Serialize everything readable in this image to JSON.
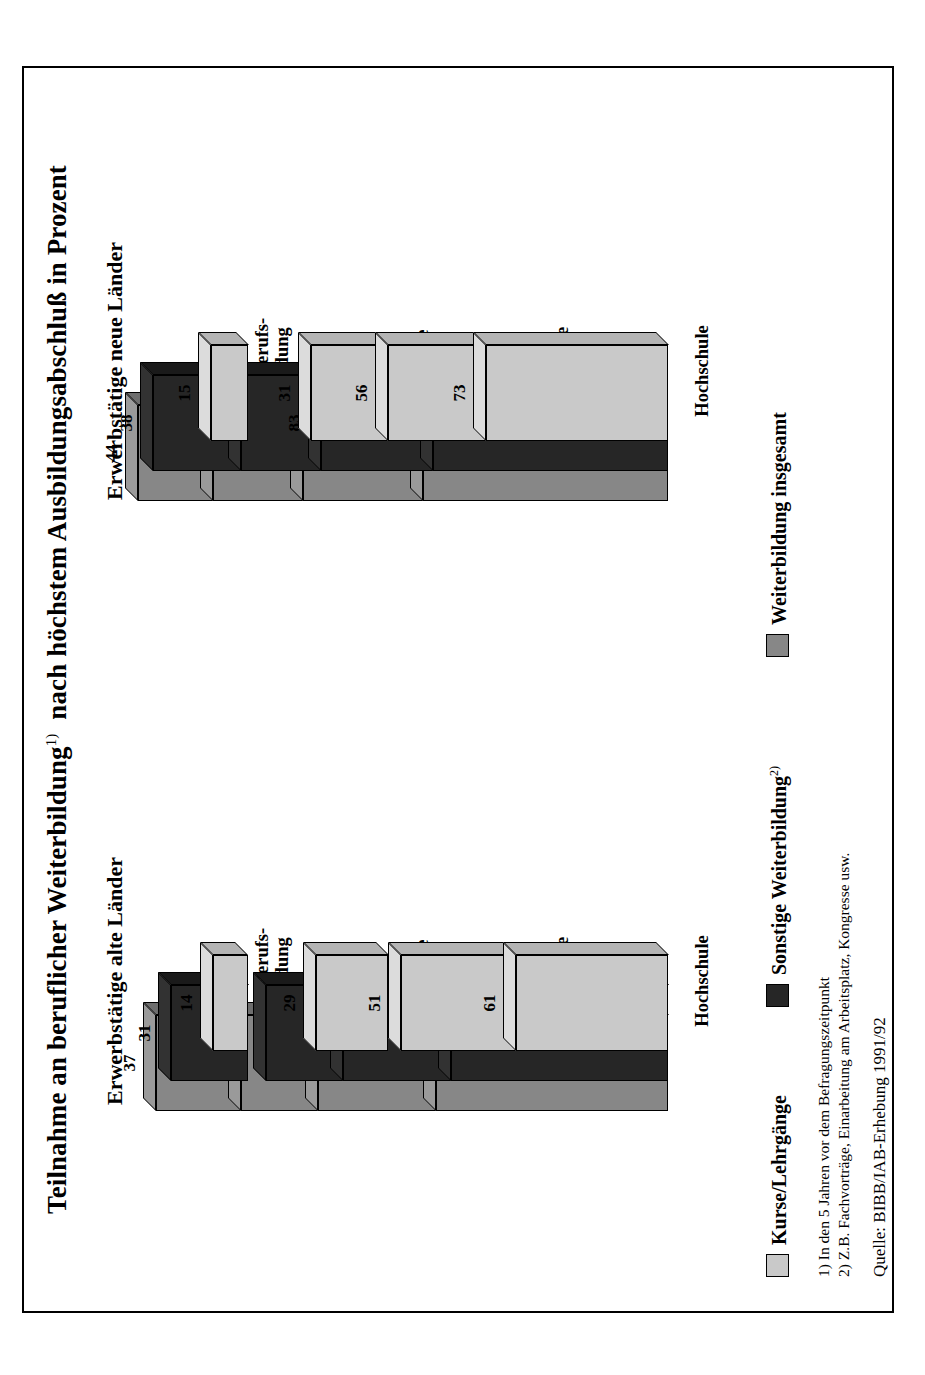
{
  "figure": {
    "title_main": "Teilnahme an beruflicher Weiterbildung",
    "title_sup": "1)",
    "title_rest": "nach höchstem Ausbildungsabschluß in Prozent"
  },
  "legend": {
    "items": [
      {
        "key": "kurse",
        "label": "Kurse/Lehrgänge",
        "sup": "",
        "color": "#c9c9c9"
      },
      {
        "key": "sonstige",
        "label": "Sonstige Weiterbildung",
        "sup": "2)",
        "color": "#262626"
      },
      {
        "key": "gesamt",
        "label": "Weiterbildung insgesamt",
        "sup": "",
        "color": "#878787"
      }
    ]
  },
  "notes": {
    "note1": "1) In den 5 Jahren vor dem Befragungszeitpunkt",
    "note2": "2) Z.B. Fachvorträge, Einarbeitung am Arbeitsplatz, Kongresse usw.",
    "source": "Quelle: BIBB/IAB-Erhebung 1991/92"
  },
  "panels": [
    {
      "key": "alte",
      "heading": "Erwerbstätige alte Länder"
    },
    {
      "key": "neue",
      "heading": "Erwerbstätige neue Länder"
    }
  ],
  "chart_data": {
    "type": "bar",
    "xlabel": "",
    "ylabel": "Prozent",
    "ylim": [
      0,
      100
    ],
    "grid": false,
    "legend_position": "bottom-left",
    "orientation": "grouped-3d-vertical",
    "categories": [
      "Ohne Berufs-\nausbildung",
      "Nur Lehre",
      "Fachschule",
      "Hochschule"
    ],
    "series_names": [
      "Weiterbildung insgesamt",
      "Sonstige Weiterbildung2)",
      "Kurse/Lehrgänge"
    ],
    "panels": [
      {
        "name": "Erwerbstätige alte Länder",
        "series": [
          {
            "name": "Weiterbildung insgesamt",
            "values": [
              37,
              59,
              84,
              93
            ]
          },
          {
            "name": "Sonstige Weiterbildung2)",
            "values": [
              31,
              49,
              74,
              87
            ]
          },
          {
            "name": "Kurse/Lehrgänge",
            "values": [
              14,
              29,
              51,
              61
            ]
          }
        ]
      },
      {
        "name": "Erwerbstätige neue Länder",
        "series": [
          {
            "name": "Weiterbildung insgesamt",
            "values": [
              44,
              70,
              90,
              98
            ]
          },
          {
            "name": "Sonstige Weiterbildung2)",
            "values": [
              38,
              59,
              83,
              94
            ]
          },
          {
            "name": "Kurse/Lehrgänge",
            "values": [
              15,
              31,
              56,
              73
            ]
          }
        ]
      }
    ],
    "annotations": [
      "1) In den 5 Jahren vor dem Befragungszeitpunkt",
      "2) Z.B. Fachvorträge, Einarbeitung am Arbeitsplatz, Kongresse usw.",
      "Quelle: BIBB/IAB-Erhebung 1991/92"
    ]
  }
}
